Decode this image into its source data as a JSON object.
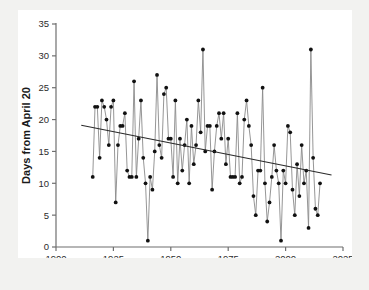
{
  "chart_data": {
    "type": "line",
    "title": "",
    "subtitle": "",
    "xlabel": "Year",
    "ylabel": "Days from April 20",
    "xlim": [
      1900,
      2025
    ],
    "ylim": [
      0,
      35
    ],
    "xticks": [
      1900,
      1925,
      1950,
      1975,
      2000,
      2025
    ],
    "xtick_labels": [
      "1900",
      "1925",
      "1950",
      "1975",
      "2000",
      "2025"
    ],
    "yticks": [
      0,
      5,
      10,
      15,
      20,
      25,
      30,
      35
    ],
    "ytick_labels": [
      "0",
      "5",
      "10",
      "15",
      "20",
      "25",
      "30",
      "35"
    ],
    "grid": false,
    "legend": "none",
    "markers": "filled-circle",
    "marker_color": "#111111",
    "line_color": "#8a8a8a",
    "trend_color": "#2a2a2a",
    "background": "#ffffff",
    "page_background": "#f2f2f0",
    "annotations": [],
    "series": [
      {
        "name": "Days from April 20",
        "x": [
          1916,
          1917,
          1918,
          1919,
          1920,
          1921,
          1922,
          1923,
          1924,
          1925,
          1926,
          1927,
          1928,
          1929,
          1930,
          1931,
          1932,
          1933,
          1934,
          1935,
          1936,
          1937,
          1938,
          1939,
          1940,
          1941,
          1942,
          1943,
          1944,
          1945,
          1946,
          1947,
          1948,
          1949,
          1950,
          1951,
          1952,
          1953,
          1954,
          1955,
          1956,
          1957,
          1958,
          1959,
          1960,
          1961,
          1962,
          1963,
          1964,
          1965,
          1966,
          1967,
          1968,
          1969,
          1970,
          1971,
          1972,
          1973,
          1974,
          1975,
          1976,
          1977,
          1978,
          1979,
          1980,
          1981,
          1982,
          1983,
          1984,
          1985,
          1986,
          1987,
          1988,
          1989,
          1990,
          1991,
          1992,
          1993,
          1994,
          1995,
          1996,
          1997,
          1998,
          1999,
          2000,
          2001,
          2002,
          2003,
          2004,
          2005,
          2006,
          2007,
          2008,
          2009,
          2010,
          2011,
          2012,
          2013,
          2014,
          2015
        ],
        "values": [
          11,
          22,
          22,
          14,
          23,
          22,
          20,
          16,
          22,
          23,
          7,
          16,
          19,
          19,
          21,
          12,
          11,
          11,
          26,
          11,
          17,
          23,
          14,
          10,
          1,
          11,
          9,
          15,
          27,
          16,
          14,
          24,
          25,
          17,
          17,
          11,
          23,
          10,
          17,
          12,
          16,
          20,
          10,
          19,
          13,
          16,
          23,
          18,
          31,
          15,
          19,
          19,
          9,
          15,
          19,
          21,
          17,
          21,
          13,
          17,
          11,
          11,
          11,
          21,
          10,
          11,
          20,
          23,
          19,
          16,
          8,
          5,
          12,
          12,
          25,
          10,
          4,
          7,
          11,
          16,
          12,
          10,
          1,
          12,
          10,
          19,
          18,
          9,
          5,
          13,
          8,
          16,
          10,
          12,
          3,
          31,
          14,
          6,
          5,
          10
        ]
      }
    ],
    "trendline": {
      "name": "linear-trend",
      "x": [
        1911,
        2020
      ],
      "y": [
        19.1,
        11.3
      ]
    }
  },
  "axes": {
    "x_axis_name": "year-axis",
    "y_axis_name": "days-axis"
  }
}
